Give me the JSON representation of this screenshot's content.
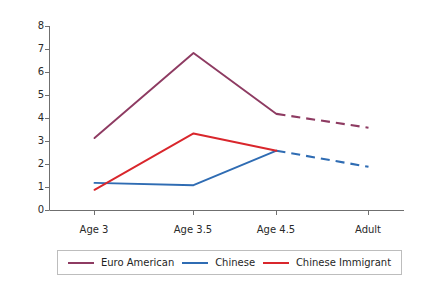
{
  "chart_data": {
    "type": "line",
    "title": "",
    "xlabel": "",
    "ylabel": "Mean personal-to-social self-description ratio",
    "categories": [
      "Age 3",
      "Age 3.5",
      "Age 4.5",
      "Adult"
    ],
    "ylim": [
      0,
      8
    ],
    "yticks": [
      0,
      1,
      2,
      3,
      4,
      5,
      6,
      7,
      8
    ],
    "grid": false,
    "legend_position": "bottom",
    "note": "Segments between Age 4.5 and Adult are drawn dashed (projected).",
    "series": [
      {
        "name": "Euro American",
        "color": "#8e3b62",
        "values": [
          3.15,
          6.85,
          4.2,
          3.6
        ],
        "dashed_from_index": 2
      },
      {
        "name": "Chinese",
        "color": "#2f6cb3",
        "values": [
          1.2,
          1.1,
          2.6,
          1.9
        ],
        "dashed_from_index": 2
      },
      {
        "name": "Chinese Immigrant",
        "color": "#d9262c",
        "values": [
          0.9,
          3.35,
          2.6,
          null
        ],
        "dashed_from_index": null
      }
    ]
  },
  "axes": {
    "y_tick_labels": [
      "8",
      "7",
      "6",
      "5",
      "4",
      "3",
      "2",
      "1",
      "0"
    ],
    "x_tick_labels": [
      "Age 3",
      "Age 3.5",
      "Age 4.5",
      "Adult"
    ],
    "y_axis_title": "Mean personal-to-social self-description ratio"
  },
  "legend": {
    "items": [
      {
        "label": "Euro American",
        "color": "#8e3b62"
      },
      {
        "label": "Chinese",
        "color": "#2f6cb3"
      },
      {
        "label": "Chinese Immigrant",
        "color": "#d9262c"
      }
    ]
  },
  "colors": {
    "euro_american": "#8e3b62",
    "chinese": "#2f6cb3",
    "chinese_immigrant": "#d9262c",
    "axis": "#6f6f6f",
    "text": "#1f1f1f",
    "legend_border": "#bdbdbd",
    "background": "#ffffff"
  }
}
